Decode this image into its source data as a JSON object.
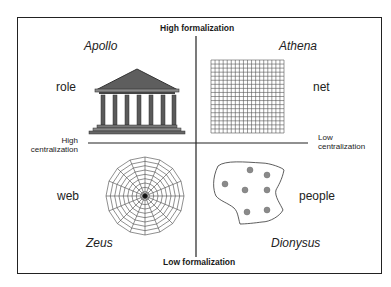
{
  "axes": {
    "top": "High formalization",
    "bottom": "Low formalization",
    "left": [
      "High",
      "centralization"
    ],
    "right": [
      "Low",
      "centralization"
    ]
  },
  "quadrants": [
    {
      "position": "top-left",
      "god": "Apollo",
      "metaphor": "role",
      "icon": "temple-icon"
    },
    {
      "position": "top-right",
      "god": "Athena",
      "metaphor": "net",
      "icon": "grid-net-icon"
    },
    {
      "position": "bottom-left",
      "god": "Zeus",
      "metaphor": "web",
      "icon": "spider-web-icon"
    },
    {
      "position": "bottom-right",
      "god": "Dionysus",
      "metaphor": "people",
      "icon": "people-cluster-icon"
    }
  ],
  "colors": {
    "line": "#222222",
    "temple_fill": "#6b6b6b",
    "dot_fill": "#8a8a8a"
  }
}
